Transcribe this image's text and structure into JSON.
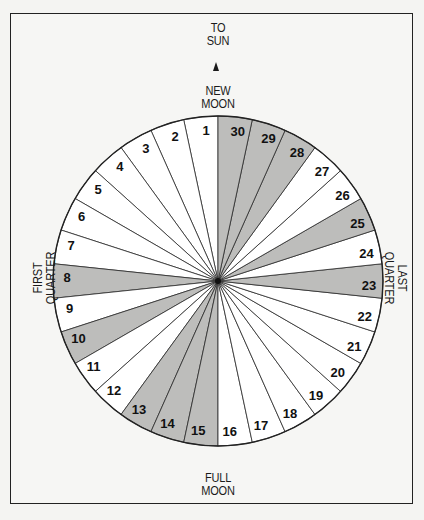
{
  "labels": {
    "to_sun_line1": "TO",
    "to_sun_line2": "SUN",
    "new_moon_line1": "NEW",
    "new_moon_line2": "MOON",
    "full_moon_line1": "FULL",
    "full_moon_line2": "MOON",
    "first_quarter_line1": "FIRST",
    "first_quarter_line2": "QUARTER",
    "last_quarter_line1": "LAST",
    "last_quarter_line2": "QUARTER"
  },
  "dial": {
    "segments": 30,
    "start_day_direction": "counterclockwise from top",
    "days": [
      {
        "day": "1",
        "shaded": false
      },
      {
        "day": "2",
        "shaded": false
      },
      {
        "day": "3",
        "shaded": false
      },
      {
        "day": "4",
        "shaded": false
      },
      {
        "day": "5",
        "shaded": false
      },
      {
        "day": "6",
        "shaded": false
      },
      {
        "day": "7",
        "shaded": false
      },
      {
        "day": "8",
        "shaded": true
      },
      {
        "day": "9",
        "shaded": false
      },
      {
        "day": "10",
        "shaded": true
      },
      {
        "day": "11",
        "shaded": false
      },
      {
        "day": "12",
        "shaded": false
      },
      {
        "day": "13",
        "shaded": true
      },
      {
        "day": "14",
        "shaded": true
      },
      {
        "day": "15",
        "shaded": true
      },
      {
        "day": "16",
        "shaded": false
      },
      {
        "day": "17",
        "shaded": false
      },
      {
        "day": "18",
        "shaded": false
      },
      {
        "day": "19",
        "shaded": false
      },
      {
        "day": "20",
        "shaded": false
      },
      {
        "day": "21",
        "shaded": false
      },
      {
        "day": "22",
        "shaded": false
      },
      {
        "day": "23",
        "shaded": true
      },
      {
        "day": "24",
        "shaded": false
      },
      {
        "day": "25",
        "shaded": true
      },
      {
        "day": "26",
        "shaded": false
      },
      {
        "day": "27",
        "shaded": false
      },
      {
        "day": "28",
        "shaded": true
      },
      {
        "day": "29",
        "shaded": true
      },
      {
        "day": "30",
        "shaded": true
      }
    ]
  },
  "colors": {
    "shaded": "#bdbdbb",
    "unshaded": "#ffffff",
    "line": "#2a2a2a",
    "background": "#f6f6f4"
  }
}
